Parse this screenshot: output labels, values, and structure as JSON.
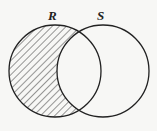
{
  "diagram": {
    "type": "venn",
    "shaded_region": "R minus S",
    "sets": [
      {
        "id": "R",
        "label": "R",
        "cx": 55,
        "cy": 71,
        "r": 46,
        "label_x": 52,
        "label_y": 19
      },
      {
        "id": "S",
        "label": "S",
        "cx": 103,
        "cy": 71,
        "r": 46,
        "label_x": 100,
        "label_y": 19
      }
    ],
    "colors": {
      "stroke": "#222222",
      "hatch": "#333333",
      "background": "#f7f7f5"
    }
  }
}
